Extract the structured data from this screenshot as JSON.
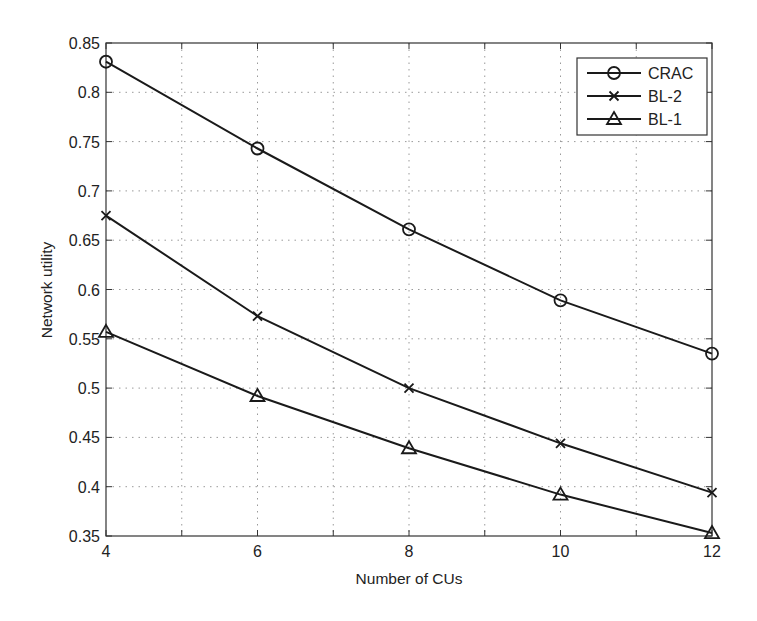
{
  "chart_data": {
    "type": "line",
    "title": "",
    "xlabel": "Number of CUs",
    "ylabel": "Network utility",
    "x": [
      4,
      6,
      8,
      10,
      12
    ],
    "xlim": [
      4,
      12
    ],
    "ylim": [
      0.35,
      0.85
    ],
    "xticks": [
      4,
      6,
      8,
      10,
      12
    ],
    "xtick_labels": [
      "4",
      "6",
      "8",
      "10",
      "12"
    ],
    "xminor_ticks": [
      4,
      5,
      6,
      7,
      8,
      9,
      10,
      11,
      12
    ],
    "yticks": [
      0.35,
      0.4,
      0.45,
      0.5,
      0.55,
      0.6,
      0.65,
      0.7,
      0.75,
      0.8,
      0.85
    ],
    "ytick_labels": [
      "0.35",
      "0.4",
      "0.45",
      "0.5",
      "0.55",
      "0.6",
      "0.65",
      "0.7",
      "0.75",
      "0.8",
      "0.85"
    ],
    "grid": true,
    "legend_position": "upper right",
    "series": [
      {
        "name": "CRAC",
        "marker": "circle",
        "values": [
          0.831,
          0.743,
          0.661,
          0.589,
          0.535
        ]
      },
      {
        "name": "BL-2",
        "marker": "x",
        "values": [
          0.675,
          0.573,
          0.5,
          0.444,
          0.394
        ]
      },
      {
        "name": "BL-1",
        "marker": "triangle",
        "values": [
          0.557,
          0.492,
          0.439,
          0.392,
          0.353
        ]
      }
    ]
  },
  "colors": {
    "line": "#1a1a1a",
    "grid": "#9a9a9a",
    "background": "#ffffff"
  }
}
